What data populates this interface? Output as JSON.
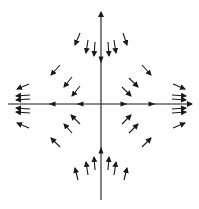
{
  "diagram": {
    "type": "vector-field",
    "colors": {
      "ink": "#1a1a1a",
      "background": "#ffffff"
    },
    "origin": [
      101,
      104
    ],
    "axes": {
      "vertical": {
        "x": 101,
        "y1": 200,
        "y2": 12,
        "arrowhead_at": "top"
      },
      "horizontal": {
        "y": 104,
        "x1": 8,
        "x2": 192,
        "arrowhead_at": "right"
      }
    },
    "axis_arrows": [
      {
        "at": [
          101,
          60
        ],
        "dir": "down"
      },
      {
        "at": [
          101,
          150
        ],
        "dir": "up"
      },
      {
        "at": [
          52,
          104
        ],
        "dir": "left"
      },
      {
        "at": [
          80,
          104
        ],
        "dir": "left"
      },
      {
        "at": [
          124,
          104
        ],
        "dir": "right"
      },
      {
        "at": [
          152,
          104
        ],
        "dir": "right"
      }
    ],
    "field_arrows": [
      {
        "quadrant": "top",
        "x1": 80,
        "y1": 33,
        "x2": 75,
        "y2": 45
      },
      {
        "quadrant": "top",
        "x1": 88,
        "y1": 40,
        "x2": 86,
        "y2": 53
      },
      {
        "quadrant": "top",
        "x1": 95,
        "y1": 42,
        "x2": 94,
        "y2": 56
      },
      {
        "quadrant": "top",
        "x1": 108,
        "y1": 42,
        "x2": 109,
        "y2": 56
      },
      {
        "quadrant": "top",
        "x1": 114,
        "y1": 40,
        "x2": 116,
        "y2": 53
      },
      {
        "quadrant": "top",
        "x1": 123,
        "y1": 33,
        "x2": 127,
        "y2": 45
      },
      {
        "quadrant": "top-left",
        "x1": 60,
        "y1": 65,
        "x2": 51,
        "y2": 75
      },
      {
        "quadrant": "top-left",
        "x1": 72,
        "y1": 77,
        "x2": 64,
        "y2": 87
      },
      {
        "quadrant": "top-left",
        "x1": 80,
        "y1": 86,
        "x2": 72,
        "y2": 96
      },
      {
        "quadrant": "top-right",
        "x1": 142,
        "y1": 65,
        "x2": 151,
        "y2": 75
      },
      {
        "quadrant": "top-right",
        "x1": 129,
        "y1": 78,
        "x2": 138,
        "y2": 87
      },
      {
        "quadrant": "top-right",
        "x1": 122,
        "y1": 87,
        "x2": 131,
        "y2": 96
      },
      {
        "quadrant": "left",
        "x1": 29,
        "y1": 84,
        "x2": 17,
        "y2": 89
      },
      {
        "quadrant": "left",
        "x1": 30,
        "y1": 95,
        "x2": 16,
        "y2": 96
      },
      {
        "quadrant": "left",
        "x1": 30,
        "y1": 99,
        "x2": 16,
        "y2": 100
      },
      {
        "quadrant": "left",
        "x1": 30,
        "y1": 109,
        "x2": 16,
        "y2": 108
      },
      {
        "quadrant": "left",
        "x1": 30,
        "y1": 113,
        "x2": 16,
        "y2": 112
      },
      {
        "quadrant": "left",
        "x1": 29,
        "y1": 128,
        "x2": 17,
        "y2": 123
      },
      {
        "quadrant": "right",
        "x1": 173,
        "y1": 84,
        "x2": 185,
        "y2": 89
      },
      {
        "quadrant": "right",
        "x1": 172,
        "y1": 95,
        "x2": 186,
        "y2": 96
      },
      {
        "quadrant": "right",
        "x1": 172,
        "y1": 99,
        "x2": 186,
        "y2": 100
      },
      {
        "quadrant": "right",
        "x1": 172,
        "y1": 109,
        "x2": 186,
        "y2": 108
      },
      {
        "quadrant": "right",
        "x1": 172,
        "y1": 113,
        "x2": 186,
        "y2": 112
      },
      {
        "quadrant": "right",
        "x1": 173,
        "y1": 128,
        "x2": 185,
        "y2": 123
      },
      {
        "quadrant": "bottom-left",
        "x1": 60,
        "y1": 147,
        "x2": 51,
        "y2": 138
      },
      {
        "quadrant": "bottom-left",
        "x1": 72,
        "y1": 133,
        "x2": 64,
        "y2": 124
      },
      {
        "quadrant": "bottom-left",
        "x1": 80,
        "y1": 124,
        "x2": 71,
        "y2": 115
      },
      {
        "quadrant": "bottom-right",
        "x1": 142,
        "y1": 147,
        "x2": 151,
        "y2": 138
      },
      {
        "quadrant": "bottom-right",
        "x1": 129,
        "y1": 133,
        "x2": 138,
        "y2": 124
      },
      {
        "quadrant": "bottom-right",
        "x1": 122,
        "y1": 124,
        "x2": 131,
        "y2": 115
      },
      {
        "quadrant": "bottom",
        "x1": 78,
        "y1": 180,
        "x2": 75,
        "y2": 168
      },
      {
        "quadrant": "bottom",
        "x1": 88,
        "y1": 175,
        "x2": 86,
        "y2": 162
      },
      {
        "quadrant": "bottom",
        "x1": 95,
        "y1": 170,
        "x2": 94,
        "y2": 157
      },
      {
        "quadrant": "bottom",
        "x1": 108,
        "y1": 170,
        "x2": 109,
        "y2": 157
      },
      {
        "quadrant": "bottom",
        "x1": 114,
        "y1": 175,
        "x2": 116,
        "y2": 162
      },
      {
        "quadrant": "bottom",
        "x1": 124,
        "y1": 180,
        "x2": 127,
        "y2": 168
      }
    ]
  }
}
